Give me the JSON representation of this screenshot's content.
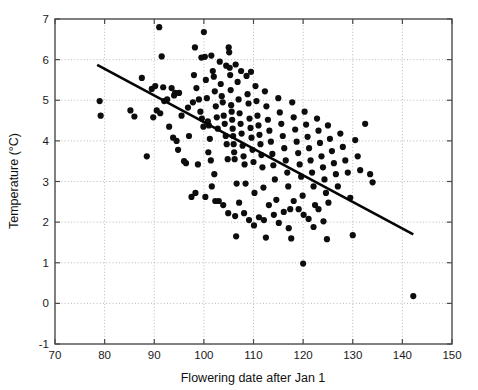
{
  "chart_data": {
    "type": "scatter",
    "title": "",
    "xlabel": "Flowering date after Jan 1",
    "ylabel": "Temperature (°C)",
    "xlim": [
      70,
      150
    ],
    "ylim": [
      -1,
      7
    ],
    "xticks": [
      70,
      80,
      90,
      100,
      110,
      120,
      130,
      140,
      150
    ],
    "yticks": [
      -1,
      0,
      1,
      2,
      3,
      4,
      5,
      6,
      7
    ],
    "xtick_labels": [
      "70",
      "80",
      "90",
      "100",
      "110",
      "120",
      "130",
      "140",
      "150"
    ],
    "ytick_labels": [
      "-1",
      "0",
      "1",
      "2",
      "3",
      "4",
      "5",
      "6",
      "7"
    ],
    "grid": true,
    "grid_style": "dotted",
    "legend": null,
    "marker": "filled-circle",
    "marker_color": "#0d0d0d",
    "marker_size": 3.1,
    "series": [
      {
        "name": "Observations",
        "points": [
          [
            79.0,
            4.98
          ],
          [
            79.2,
            4.62
          ],
          [
            85.2,
            4.75
          ],
          [
            86.0,
            4.6
          ],
          [
            87.5,
            5.55
          ],
          [
            88.5,
            3.62
          ],
          [
            89.5,
            5.28
          ],
          [
            90.2,
            5.35
          ],
          [
            90.5,
            4.75
          ],
          [
            91.0,
            6.8
          ],
          [
            91.5,
            6.08
          ],
          [
            91.8,
            5.32
          ],
          [
            92.0,
            4.98
          ],
          [
            92.6,
            5.02
          ],
          [
            93.0,
            4.35
          ],
          [
            94.0,
            5.12
          ],
          [
            94.2,
            5.18
          ],
          [
            94.5,
            4.0
          ],
          [
            95.5,
            4.62
          ],
          [
            96.0,
            3.5
          ],
          [
            96.4,
            3.45
          ],
          [
            97.0,
            4.12
          ],
          [
            97.5,
            2.62
          ],
          [
            98.0,
            5.62
          ],
          [
            98.2,
            6.3
          ],
          [
            98.5,
            5.3
          ],
          [
            98.8,
            3.42
          ],
          [
            99.0,
            5.02
          ],
          [
            99.3,
            4.72
          ],
          [
            99.6,
            4.55
          ],
          [
            99.9,
            4.35
          ],
          [
            100.0,
            6.68
          ],
          [
            100.2,
            6.07
          ],
          [
            100.4,
            5.5
          ],
          [
            100.6,
            5.05
          ],
          [
            100.8,
            4.48
          ],
          [
            101.0,
            4.38
          ],
          [
            101.2,
            4.05
          ],
          [
            101.4,
            3.52
          ],
          [
            101.6,
            2.88
          ],
          [
            101.8,
            5.72
          ],
          [
            102.0,
            5.58
          ],
          [
            102.2,
            5.22
          ],
          [
            102.4,
            4.85
          ],
          [
            102.6,
            4.58
          ],
          [
            102.8,
            4.3
          ],
          [
            103.0,
            2.52
          ],
          [
            103.2,
            5.95
          ],
          [
            103.4,
            5.4
          ],
          [
            103.6,
            5.1
          ],
          [
            103.8,
            4.95
          ],
          [
            104.0,
            4.62
          ],
          [
            104.2,
            4.42
          ],
          [
            104.4,
            4.12
          ],
          [
            104.6,
            3.92
          ],
          [
            104.8,
            3.55
          ],
          [
            105.0,
            6.3
          ],
          [
            105.1,
            6.18
          ],
          [
            105.2,
            5.8
          ],
          [
            105.3,
            5.62
          ],
          [
            105.4,
            5.25
          ],
          [
            105.5,
            4.88
          ],
          [
            105.6,
            4.72
          ],
          [
            105.7,
            4.52
          ],
          [
            105.8,
            4.3
          ],
          [
            105.9,
            4.12
          ],
          [
            106.0,
            3.92
          ],
          [
            106.1,
            3.72
          ],
          [
            106.2,
            3.55
          ],
          [
            106.3,
            2.15
          ],
          [
            106.5,
            1.65
          ],
          [
            106.8,
            5.45
          ],
          [
            107.0,
            5.02
          ],
          [
            107.2,
            4.68
          ],
          [
            107.4,
            4.42
          ],
          [
            107.6,
            4.18
          ],
          [
            107.8,
            3.88
          ],
          [
            108.0,
            3.62
          ],
          [
            108.2,
            3.42
          ],
          [
            108.4,
            2.95
          ],
          [
            108.6,
            5.6
          ],
          [
            108.8,
            5.15
          ],
          [
            109.0,
            4.92
          ],
          [
            109.2,
            4.55
          ],
          [
            109.4,
            4.32
          ],
          [
            109.6,
            4.08
          ],
          [
            109.8,
            3.78
          ],
          [
            110.0,
            3.48
          ],
          [
            110.2,
            2.72
          ],
          [
            110.4,
            5.35
          ],
          [
            110.6,
            4.98
          ],
          [
            110.8,
            4.62
          ],
          [
            111.0,
            4.38
          ],
          [
            111.2,
            4.15
          ],
          [
            111.4,
            3.92
          ],
          [
            111.6,
            3.65
          ],
          [
            111.8,
            3.35
          ],
          [
            112.0,
            2.85
          ],
          [
            112.3,
            5.22
          ],
          [
            112.6,
            4.85
          ],
          [
            112.9,
            4.52
          ],
          [
            113.2,
            4.25
          ],
          [
            113.5,
            3.98
          ],
          [
            113.8,
            3.68
          ],
          [
            114.0,
            3.4
          ],
          [
            114.3,
            3.05
          ],
          [
            114.6,
            2.55
          ],
          [
            115.0,
            5.05
          ],
          [
            115.3,
            4.7
          ],
          [
            115.6,
            4.42
          ],
          [
            115.9,
            4.12
          ],
          [
            116.2,
            3.82
          ],
          [
            116.5,
            3.52
          ],
          [
            116.8,
            3.22
          ],
          [
            117.0,
            2.88
          ],
          [
            117.4,
            2.32
          ],
          [
            117.8,
            4.95
          ],
          [
            118.1,
            4.58
          ],
          [
            118.4,
            4.28
          ],
          [
            118.7,
            3.98
          ],
          [
            119.0,
            3.7
          ],
          [
            119.3,
            3.42
          ],
          [
            119.6,
            3.12
          ],
          [
            119.9,
            2.65
          ],
          [
            120.0,
            0.98
          ],
          [
            120.3,
            4.72
          ],
          [
            120.6,
            4.4
          ],
          [
            120.9,
            4.1
          ],
          [
            121.2,
            3.82
          ],
          [
            121.5,
            3.52
          ],
          [
            121.8,
            3.22
          ],
          [
            122.1,
            2.88
          ],
          [
            122.4,
            2.42
          ],
          [
            122.8,
            4.55
          ],
          [
            123.1,
            4.25
          ],
          [
            123.4,
            3.95
          ],
          [
            123.7,
            3.62
          ],
          [
            124.0,
            3.35
          ],
          [
            124.3,
            3.05
          ],
          [
            124.6,
            2.72
          ],
          [
            125.0,
            4.38
          ],
          [
            125.4,
            4.05
          ],
          [
            125.8,
            3.75
          ],
          [
            126.2,
            3.45
          ],
          [
            126.6,
            3.18
          ],
          [
            127.0,
            2.88
          ],
          [
            127.5,
            4.18
          ],
          [
            128.0,
            3.85
          ],
          [
            128.5,
            3.52
          ],
          [
            129.0,
            3.22
          ],
          [
            129.5,
            2.6
          ],
          [
            130.0,
            1.68
          ],
          [
            130.5,
            4.02
          ],
          [
            131.0,
            3.62
          ],
          [
            131.5,
            3.28
          ],
          [
            132.5,
            4.42
          ],
          [
            133.5,
            3.18
          ],
          [
            134.0,
            2.98
          ],
          [
            142.2,
            0.18
          ],
          [
            93.5,
            5.3
          ],
          [
            95.0,
            5.18
          ],
          [
            96.8,
            4.82
          ],
          [
            97.8,
            4.95
          ],
          [
            100.9,
            3.72
          ],
          [
            102.1,
            3.18
          ],
          [
            103.9,
            2.42
          ],
          [
            104.9,
            2.22
          ],
          [
            106.6,
            2.95
          ],
          [
            107.1,
            2.48
          ],
          [
            108.1,
            2.22
          ],
          [
            109.1,
            2.05
          ],
          [
            110.1,
            1.92
          ],
          [
            111.1,
            2.12
          ],
          [
            112.1,
            2.05
          ],
          [
            113.1,
            2.42
          ],
          [
            114.1,
            2.18
          ],
          [
            115.1,
            1.98
          ],
          [
            116.1,
            2.25
          ],
          [
            117.1,
            1.85
          ],
          [
            118.1,
            2.52
          ],
          [
            119.1,
            2.32
          ],
          [
            120.1,
            2.18
          ],
          [
            121.1,
            2.08
          ],
          [
            122.1,
            1.88
          ],
          [
            123.1,
            2.32
          ],
          [
            124.1,
            2.02
          ],
          [
            125.1,
            2.48
          ],
          [
            99.5,
            6.05
          ],
          [
            101.5,
            6.1
          ],
          [
            104.5,
            5.85
          ],
          [
            106.4,
            5.88
          ],
          [
            93.8,
            4.08
          ],
          [
            94.8,
            3.78
          ],
          [
            91.2,
            4.68
          ],
          [
            89.8,
            4.58
          ],
          [
            98.3,
            2.72
          ],
          [
            100.3,
            2.62
          ],
          [
            102.3,
            2.52
          ],
          [
            112.5,
            1.62
          ],
          [
            117.6,
            1.6
          ],
          [
            124.8,
            1.58
          ],
          [
            107.5,
            5.72
          ],
          [
            109.5,
            5.7
          ]
        ]
      }
    ],
    "fit_line": {
      "name": "Linear regression",
      "x_start": 78.5,
      "y_start": 5.87,
      "x_end": 142.2,
      "y_end": 1.7,
      "color": "#050505",
      "width": 2.6
    }
  }
}
